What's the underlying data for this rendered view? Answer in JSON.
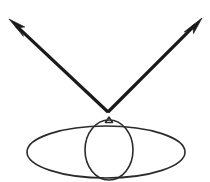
{
  "figure": {
    "title": "",
    "caption": "",
    "background_color": "#ffffff",
    "width": 210,
    "height": 182
  },
  "style": {
    "ray_color": "#1a1a1a",
    "ray_width": 3.2,
    "outline_color": "#2b2b2b",
    "outline_width": 1.6,
    "arrowhead_color": "#1a1a1a"
  },
  "geometry": {
    "vertex": {
      "x": 108,
      "y": 112
    },
    "left_ray": {
      "label": "incident-ray",
      "from": {
        "x": 108,
        "y": 112
      },
      "to": {
        "x": 9,
        "y": 19
      },
      "arrow_at": "to"
    },
    "right_ray": {
      "label": "reflected-ray",
      "from": {
        "x": 108,
        "y": 112
      },
      "to": {
        "x": 202,
        "y": 18
      },
      "arrow_at": "to"
    },
    "ellipse": {
      "label": "horizontal-ellipse",
      "cx": 106,
      "cy": 152,
      "rx": 79,
      "ry": 26
    },
    "egg": {
      "label": "egg-outline",
      "cx": 109,
      "cy": 150,
      "rx": 24,
      "ry": 30,
      "cusp_y": 117
    }
  },
  "elements": {
    "left_arrow_name": "incident-ray-arrow",
    "right_arrow_name": "reflected-ray-arrow",
    "vertex_name": "ray-vertex",
    "ellipse_name": "ellipse-outline",
    "egg_name": "egg-shape-outline",
    "cusp_name": "egg-apex-cusp"
  },
  "chart_data": {
    "type": "diagram",
    "title": "",
    "shapes": [
      {
        "kind": "arrow",
        "name": "left-arrow",
        "start": [
          108,
          112
        ],
        "end": [
          9,
          19
        ],
        "direction": "up-left",
        "head_at_end": true
      },
      {
        "kind": "arrow",
        "name": "right-arrow",
        "start": [
          108,
          112
        ],
        "end": [
          202,
          18
        ],
        "direction": "up-right",
        "head_at_end": true
      },
      {
        "kind": "ellipse",
        "name": "wide-ellipse",
        "center": [
          106,
          152
        ],
        "radii": [
          79,
          26
        ],
        "filled": false
      },
      {
        "kind": "ellipse",
        "name": "egg",
        "center": [
          109,
          150
        ],
        "radii": [
          24,
          30
        ],
        "filled": false
      }
    ]
  }
}
